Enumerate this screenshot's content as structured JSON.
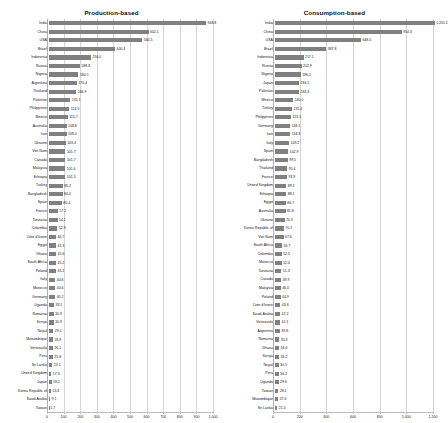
{
  "figure": {
    "background": "#ffffff",
    "bar_color": "#808080",
    "grid_color": "#d4d4d4"
  },
  "panels": [
    {
      "key": "production",
      "title": "Production-based"
    },
    {
      "key": "consumption",
      "title": "Consumption-based"
    }
  ],
  "chart_data": [
    {
      "type": "bar",
      "orientation": "horizontal",
      "title": "Production-based",
      "xlabel": "",
      "ylabel": "",
      "xlim": [
        0,
        1000
      ],
      "xticks": [
        0,
        100,
        200,
        300,
        400,
        500,
        600,
        700,
        800,
        900,
        1000
      ],
      "xticklabels": [
        "0",
        "100",
        "200",
        "300",
        "400",
        "500",
        "600",
        "700",
        "800",
        "900",
        "1,000"
      ],
      "grid": true,
      "legend": "none",
      "bar_color": "#808080",
      "value_labels": true,
      "categories": [
        "India",
        "China",
        "USA",
        "Brazil",
        "Indonesia",
        "Russia",
        "Nigeria",
        "Argentina",
        "Thailand",
        "Pakistan",
        "Philippines",
        "Mexico",
        "Australia",
        "Iran",
        "Ukraine",
        "Viet Nam",
        "Canada",
        "Malaysia",
        "Ethiopia",
        "Turkey",
        "Bangladesh",
        "Spain",
        "France",
        "Tanzania",
        "Colombia",
        "Cote d'Ivoire",
        "Egypt",
        "Ghana",
        "South Africa",
        "Poland",
        "Italy",
        "Morocco",
        "Germany",
        "Uganda",
        "Romania",
        "Kenya",
        "Nepal",
        "Mozambique",
        "Venezuela",
        "Peru",
        "Sri Lanka",
        "United Kingdom",
        "Japan",
        "Korea Republic of",
        "Saudi Arabia",
        "Taiwan"
      ],
      "values": [
        948.8,
        602.1,
        564.5,
        400.4,
        256.0,
        188.8,
        180.1,
        170.4,
        166.9,
        131.1,
        124.5,
        115.7,
        108.8,
        108.0,
        103.3,
        101.7,
        101.7,
        101.4,
        101.5,
        85.2,
        84.4,
        80.4,
        57.2,
        54.1,
        52.9,
        44.7,
        45.3,
        45.6,
        45.2,
        45.1,
        40.6,
        40.6,
        40.2,
        33.1,
        30.9,
        30.9,
        29.1,
        26.9,
        26.1,
        25.8,
        23.1,
        17.3,
        18.2,
        13.8,
        9.1,
        1.7
      ]
    },
    {
      "type": "bar",
      "orientation": "horizontal",
      "title": "Consumption-based",
      "xlabel": "",
      "ylabel": "",
      "xlim": [
        0,
        1200
      ],
      "xticks": [
        0,
        200,
        400,
        600,
        800,
        1000,
        1200
      ],
      "xticklabels": [
        "0",
        "200",
        "400",
        "600",
        "800",
        "1,000",
        "1,200"
      ],
      "grid": true,
      "legend": "none",
      "bar_color": "#808080",
      "value_labels": true,
      "categories": [
        "India",
        "China",
        "USA",
        "Brazil",
        "Indonesia",
        "Russia",
        "Nigeria",
        "Japan",
        "Pakistan",
        "Mexico",
        "Turkey",
        "Philippines",
        "Germany",
        "Iran",
        "Italy",
        "Spain",
        "Bangladesh",
        "Thailand",
        "France",
        "United Kingdom",
        "Ethiopia",
        "Egypt",
        "Australia",
        "Ukraine",
        "Korea Republic of",
        "Viet Nam",
        "South Africa",
        "Colombia",
        "Morocco",
        "Tanzania",
        "Canada",
        "Malaysia",
        "Poland",
        "Cote d'Ivoire",
        "Saudi Arabia",
        "Venezuela",
        "Argentina",
        "Romania",
        "Ghana",
        "Kenya",
        "Nepal",
        "Peru",
        "Uganda",
        "Taiwan",
        "Mozambique",
        "Sri Lanka"
      ],
      "values": [
        1201.1,
        954.3,
        648.0,
        387.8,
        217.1,
        202.9,
        196.2,
        184.5,
        184.3,
        140.0,
        131.4,
        123.1,
        118.1,
        118.8,
        109.2,
        102.9,
        99.5,
        95.4,
        93.9,
        89.1,
        88.1,
        84.7,
        81.8,
        74.3,
        70.1,
        67.6,
        56.7,
        52.3,
        52.4,
        51.3,
        49.9,
        46.0,
        44.9,
        43.6,
        42.2,
        41.3,
        39.8,
        35.3,
        34.6,
        34.2,
        30.5,
        30.2,
        29.6,
        28.1,
        27.6,
        21.5
      ]
    }
  ]
}
